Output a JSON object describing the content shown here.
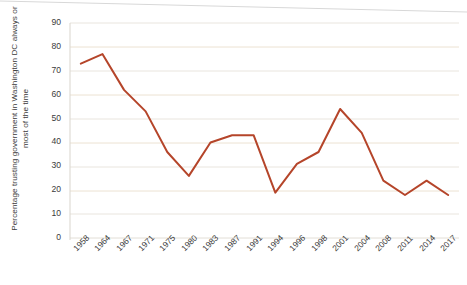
{
  "chart_data": {
    "type": "line",
    "title": "",
    "xlabel": "",
    "ylabel": "Percentage trusting government in Washington DC always or most of the time",
    "categories": [
      "1958",
      "1964",
      "1967",
      "1971",
      "1975",
      "1980",
      "1983",
      "1987",
      "1991",
      "1994",
      "1996",
      "1998",
      "2001",
      "2004",
      "2008",
      "2011",
      "2014",
      "2017"
    ],
    "values": [
      73,
      77,
      62,
      53,
      36,
      26,
      40,
      43,
      43,
      19,
      31,
      36,
      54,
      44,
      24,
      18,
      24,
      18
    ],
    "series": [
      {
        "name": "Trust in government",
        "values": [
          73,
          77,
          62,
          53,
          36,
          26,
          40,
          43,
          43,
          19,
          31,
          36,
          54,
          44,
          24,
          18,
          24,
          18
        ]
      }
    ],
    "ylim": [
      0,
      90
    ],
    "yticks": [
      0,
      10,
      20,
      30,
      40,
      50,
      60,
      70,
      80,
      90
    ],
    "ytick_labels": [
      "0",
      "10",
      "20",
      "30",
      "40",
      "50",
      "60",
      "70",
      "80",
      "90"
    ],
    "grid": true,
    "grid_axis": "y",
    "legend": "none",
    "line_color": "#b5452a",
    "grid_color": "#e8e4dc",
    "text_color": "#3b3b3b",
    "background": "#ffffff"
  }
}
